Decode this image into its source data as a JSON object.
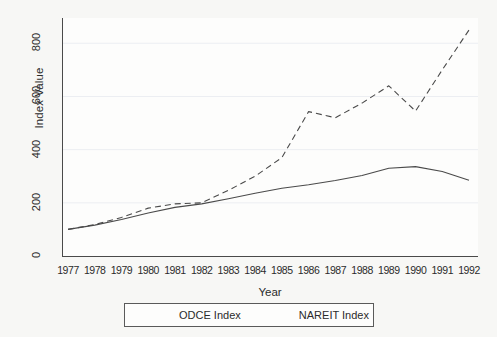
{
  "chart_data": {
    "type": "line",
    "title": "",
    "xlabel": "Year",
    "ylabel": "Index Value",
    "x": [
      1977,
      1978,
      1979,
      1980,
      1981,
      1982,
      1983,
      1984,
      1985,
      1986,
      1987,
      1988,
      1989,
      1990,
      1991,
      1992
    ],
    "categories": [
      "1977",
      "1978",
      "1979",
      "1980",
      "1981",
      "1982",
      "1983",
      "1984",
      "1985",
      "1986",
      "1987",
      "1988",
      "1989",
      "1990",
      "1991",
      "1992"
    ],
    "xlim": [
      1977,
      1992
    ],
    "ylim": [
      0,
      880
    ],
    "yticks": [
      0,
      200,
      400,
      600,
      800
    ],
    "ytick_labels": [
      "0",
      "200",
      "400",
      "600",
      "800"
    ],
    "grid": "horizontal-faint",
    "legend_position": "below-axis",
    "series": [
      {
        "name": "ODCE Index",
        "style": "solid",
        "color": "#4a4a4a",
        "values": [
          100,
          116,
          137,
          162,
          183,
          196,
          215,
          236,
          255,
          268,
          284,
          303,
          330,
          336,
          318,
          285
        ]
      },
      {
        "name": "NAREIT Index",
        "style": "dashed",
        "color": "#4a4a4a",
        "values": [
          100,
          118,
          145,
          180,
          196,
          200,
          247,
          300,
          370,
          543,
          520,
          575,
          640,
          545,
          700,
          850
        ]
      }
    ]
  },
  "legend": {
    "entries": [
      {
        "label": "ODCE Index",
        "style": "solid"
      },
      {
        "label": "NAREIT Index",
        "style": "dashed"
      }
    ]
  },
  "colors": {
    "background": "#f7f7f5",
    "plot_background": "#fdfdfc",
    "axis": "#4a4a4a",
    "text": "#2b2b2b",
    "gridline": "#eceef2"
  }
}
